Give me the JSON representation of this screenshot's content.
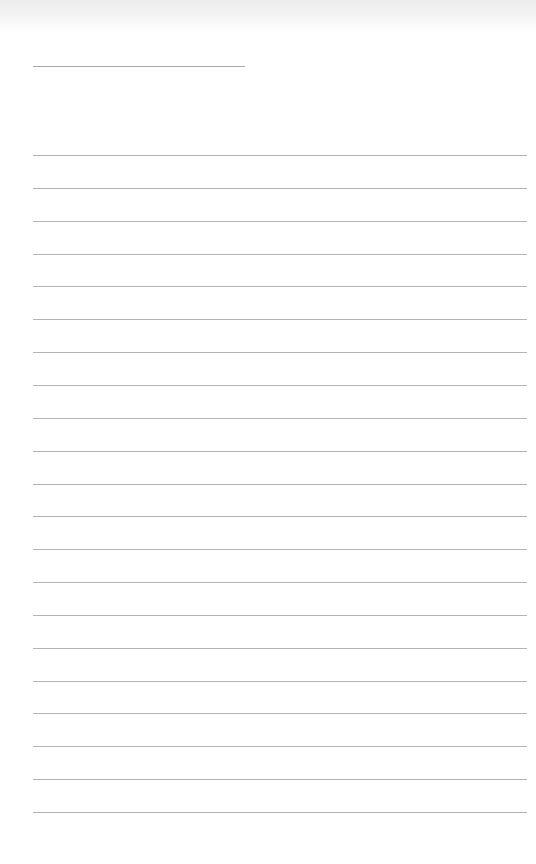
{
  "page": {
    "type": "lined-notebook-page",
    "background_color": "#ffffff",
    "line_color": "#b4b4b4",
    "title_line": {
      "present": true,
      "text": ""
    },
    "ruled_lines": {
      "count": 21,
      "start_y": 155,
      "spacing": 32.85,
      "texts": [
        "",
        "",
        "",
        "",
        "",
        "",
        "",
        "",
        "",
        "",
        "",
        "",
        "",
        "",
        "",
        "",
        "",
        "",
        "",
        "",
        ""
      ]
    }
  }
}
